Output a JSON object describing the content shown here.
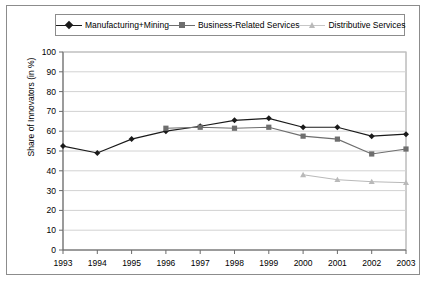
{
  "figure": {
    "border_color": "#8c8c8c",
    "background": "#ffffff"
  },
  "legend": {
    "position": "top",
    "entries": [
      {
        "label": "Manufacturing+Mining",
        "marker": "diamond-marker-icon",
        "color": "#1a1a1a"
      },
      {
        "label": "Business-Related Services",
        "marker": "square-marker-icon",
        "color": "#6e6e6e"
      },
      {
        "label": "Distributive Services",
        "marker": "triangle-marker-icon",
        "color": "#b9b9b9"
      }
    ]
  },
  "axes": {
    "ylabel": "Share of Innovators (in %)",
    "xlabel": "",
    "yticks": [
      "100",
      "90",
      "80",
      "70",
      "60",
      "50",
      "40",
      "30",
      "20",
      "10",
      "0"
    ],
    "xticks": [
      "1993",
      "1994",
      "1995",
      "1996",
      "1997",
      "1998",
      "1999",
      "2000",
      "2001",
      "2002",
      "2003"
    ]
  },
  "chart_data": {
    "type": "line",
    "title": "",
    "xlabel": "",
    "ylabel": "Share of Innovators (in %)",
    "x": [
      1993,
      1994,
      1995,
      1996,
      1997,
      1998,
      1999,
      2000,
      2001,
      2002,
      2003
    ],
    "categories": [
      "1993",
      "1994",
      "1995",
      "1996",
      "1997",
      "1998",
      "1999",
      "2000",
      "2001",
      "2002",
      "2003"
    ],
    "ylim": [
      0,
      100
    ],
    "ytick_step": 10,
    "xlim": [
      1993,
      2003
    ],
    "grid": "horizontal",
    "legend_position": "top",
    "series": [
      {
        "name": "Manufacturing+Mining",
        "color": "#1a1a1a",
        "marker": "diamond",
        "values": [
          52.5,
          49.0,
          56.0,
          60.0,
          62.5,
          65.5,
          66.5,
          62.0,
          62.0,
          57.5,
          58.5
        ]
      },
      {
        "name": "Business-Related Services",
        "color": "#6e6e6e",
        "marker": "square",
        "values": [
          null,
          null,
          null,
          61.5,
          62.0,
          61.5,
          62.0,
          57.5,
          56.0,
          48.5,
          51.0
        ]
      },
      {
        "name": "Distributive Services",
        "color": "#b9b9b9",
        "marker": "triangle",
        "values": [
          null,
          null,
          null,
          null,
          null,
          null,
          null,
          38.0,
          35.5,
          34.5,
          34.0
        ]
      }
    ]
  }
}
